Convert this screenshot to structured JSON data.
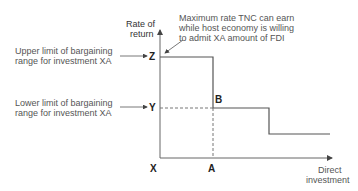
{
  "axes": {
    "y_label_line1": "Rate of",
    "y_label_line2": "return",
    "x_label_line1": "Direct",
    "x_label_line2": "investment"
  },
  "points": {
    "origin": "X",
    "z": "Z",
    "y": "Y",
    "a": "A",
    "b": "B"
  },
  "annotations": {
    "upper_line1": "Upper limit of bargaining",
    "upper_line2": "range for investment XA",
    "lower_line1": "Lower limit of bargaining",
    "lower_line2": "range for investment XA",
    "max_line1": "Maximum rate TNC can earn",
    "max_line2": "while host economy is willing",
    "max_line3": "to admit XA amount of FDI"
  },
  "colors": {
    "line": "#555555",
    "text": "#555555"
  }
}
